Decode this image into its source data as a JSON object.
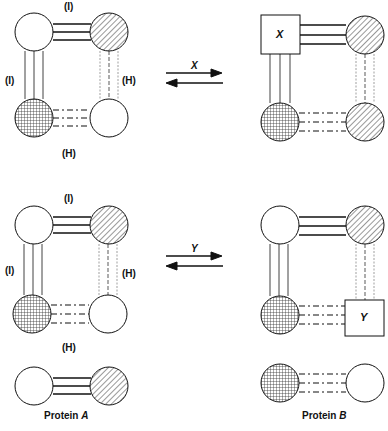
{
  "figure": {
    "panels": [
      {
        "id": "top-left",
        "labels": {
          "top": "(I)",
          "left": "(I)",
          "right": "(H)",
          "bottom": "(H)"
        }
      },
      {
        "id": "bottom-left",
        "labels": {
          "top": "(I)",
          "left": "(I)",
          "right": "(H)",
          "bottom": "(H)"
        }
      },
      {
        "id": "top-right",
        "box_label": "X"
      },
      {
        "id": "bottom-right",
        "box_label": "Y"
      }
    ],
    "arrows": [
      {
        "label": "X"
      },
      {
        "label": "Y"
      }
    ],
    "captions": {
      "protein_a_prefix": "Protein ",
      "protein_a_letter": "A",
      "protein_b_prefix": "Protein ",
      "protein_b_letter": "B"
    }
  }
}
